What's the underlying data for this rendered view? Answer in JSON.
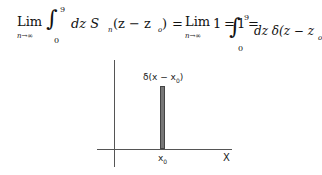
{
  "equation": {
    "lim1": "Lim",
    "lim1_sub": "n→∞",
    "int1_upper": "9",
    "int1_lower": "0",
    "integrand1": "dz S",
    "integrand1_sub": "n",
    "arg1": "(z − z",
    "arg1_sub": "o",
    "arg1_close": ")",
    "eq1": "=",
    "lim2": "Lim",
    "lim2_sub": "n→∞",
    "one": "1",
    "eq2": "=",
    "one2": "1",
    "eq3": "=",
    "int2_upper": "9",
    "int2_lower": "0",
    "integrand2": "dz δ(z − z",
    "integrand2_sub": "o",
    "integrand2_close": ")"
  },
  "figure": {
    "peak_label": "δ(x − x",
    "peak_label_sub": "0",
    "peak_label_close": ")",
    "x0_label": "x",
    "x0_label_sub": "0",
    "x_axis_label": "X"
  }
}
